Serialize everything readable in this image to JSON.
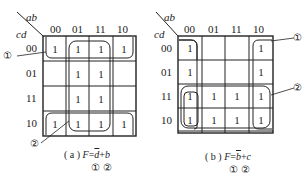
{
  "maps": [
    {
      "id": "a",
      "var_row": "cd",
      "var_col": "ab",
      "col_labels": [
        "00",
        "01",
        "11",
        "10"
      ],
      "row_labels": [
        "00",
        "01",
        "11",
        "10"
      ],
      "cells": [
        [
          "1",
          "1",
          "1",
          "1"
        ],
        [
          "",
          "1",
          "1",
          ""
        ],
        [
          "",
          "1",
          "1",
          ""
        ],
        [
          "1",
          "1",
          "1",
          "1"
        ]
      ],
      "caption_prefix": "( a ) ",
      "caption_f": "F",
      "caption_eq": "=",
      "caption_term1": "d",
      "caption_plus": "+",
      "caption_term2": "b",
      "caption_markers": "① ②",
      "groups": [
        {
          "marker": "①",
          "description": "rows 00 and 10 (wrap-around), all columns: d̄"
        },
        {
          "marker": "②",
          "description": "columns 01 and 11, all rows: b"
        }
      ],
      "callout_1": "①",
      "callout_2": "②"
    },
    {
      "id": "b",
      "var_row": "cd",
      "var_col": "ab",
      "col_labels": [
        "00",
        "01",
        "11",
        "10"
      ],
      "row_labels": [
        "00",
        "01",
        "11",
        "10"
      ],
      "cells": [
        [
          "1",
          "",
          "",
          "1"
        ],
        [
          "1",
          "",
          "",
          "1"
        ],
        [
          "1",
          "1",
          "1",
          "1"
        ],
        [
          "1",
          "1",
          "1",
          "1"
        ]
      ],
      "caption_prefix": "( b ) ",
      "caption_f": "F",
      "caption_eq": "=",
      "caption_term1": "b",
      "caption_plus": "+",
      "caption_term2": "c",
      "caption_markers": "① ②",
      "groups": [
        {
          "marker": "①",
          "description": "columns 00 and 10 (wrap-around), all rows: b̄"
        },
        {
          "marker": "②",
          "description": "rows 11 and 10, all columns: c"
        }
      ],
      "callout_1": "①",
      "callout_2": "②"
    }
  ],
  "colors": {
    "line": "#222222",
    "background": "#ffffff"
  }
}
